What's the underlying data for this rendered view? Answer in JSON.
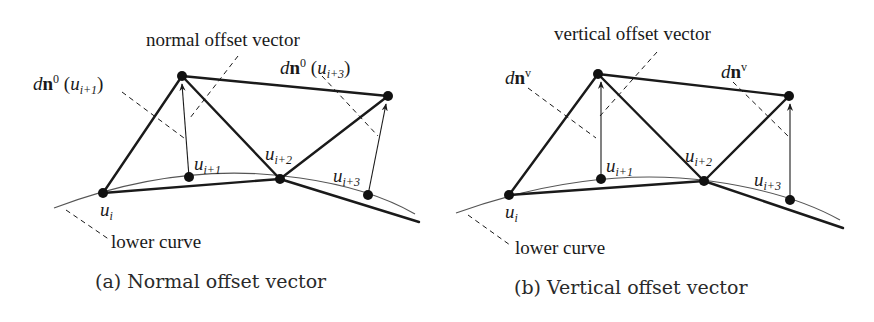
{
  "figure": {
    "panels": [
      {
        "id": "a",
        "caption": "(a) Normal offset vector",
        "title_label": "normal offset vector",
        "vector_label_left": {
          "prefix": "d",
          "bold": "n",
          "sup": "0",
          "arg_open": " (",
          "arg_var": "u",
          "arg_sub": "i+1",
          "arg_close": ")"
        },
        "vector_label_right": {
          "prefix": "d",
          "bold": "n",
          "sup": "0",
          "arg_open": " (",
          "arg_var": "u",
          "arg_sub": "i+3",
          "arg_close": ")"
        },
        "points": [
          {
            "var": "u",
            "sub": "i"
          },
          {
            "var": "u",
            "sub": "i+1"
          },
          {
            "var": "u",
            "sub": "i+2"
          },
          {
            "var": "u",
            "sub": "i+3"
          }
        ],
        "curve_label": "lower curve"
      },
      {
        "id": "b",
        "caption": "(b) Vertical offset vector",
        "title_label": "vertical offset vector",
        "vector_label_left": {
          "prefix": "d",
          "bold": "n",
          "sup": "v"
        },
        "vector_label_right": {
          "prefix": "d",
          "bold": "n",
          "sup": "v"
        },
        "points": [
          {
            "var": "u",
            "sub": "i"
          },
          {
            "var": "u",
            "sub": "i+1"
          },
          {
            "var": "u",
            "sub": "i+2"
          },
          {
            "var": "u",
            "sub": "i+3"
          }
        ],
        "curve_label": "lower curve"
      }
    ],
    "colors": {
      "ink": "#1a1a1a",
      "curve": "#555555",
      "background": "#ffffff"
    }
  }
}
